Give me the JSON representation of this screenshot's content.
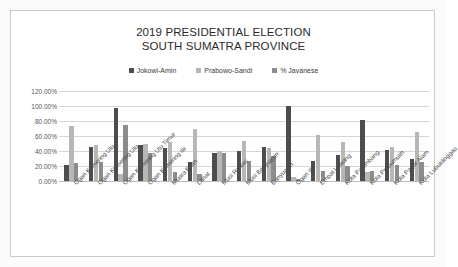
{
  "chart_data": {
    "type": "bar",
    "title": "2019 PRESIDENTIAL ELECTION SOUTH SUMATRA PROVINCE",
    "title_lines": [
      "2019 PRESIDENTIAL ELECTION",
      "SOUTH SUMATRA PROVINCE"
    ],
    "xlabel": "",
    "ylabel": "",
    "ylim": [
      0,
      120
    ],
    "ytick_labels": [
      "120.00%",
      "100.00%",
      "80.00%",
      "60.00%",
      "40.00%",
      "20.00%",
      "0.00%"
    ],
    "ytick_values": [
      120,
      100,
      80,
      60,
      40,
      20,
      0
    ],
    "grid": true,
    "legend_position": "top",
    "categories": [
      "Ogan Komering Ulu",
      "Ogan Komering Ulu",
      "Ogan Komering Ulu Timur",
      "Ogan Komering Ilir",
      "Muara Enim",
      "Lahat",
      "Musi Rawas",
      "Musi Banyuasin",
      "Banyuasin",
      "Ogan Ilir",
      "Empat Lawang",
      "Kota Palembang",
      "Kota Prabumulih",
      "Kota Pagar Alam",
      "Kota Lubuklinggau"
    ],
    "series": [
      {
        "name": "Jokowi-Amin",
        "color": "#4d4d4d",
        "values": [
          22,
          45,
          97,
          48,
          44,
          25,
          37,
          40,
          46,
          100,
          27,
          35,
          82,
          42,
          30
        ]
      },
      {
        "name": "Prabowo-Sandi",
        "color": "#b7b7b7",
        "values": [
          73,
          48,
          10,
          50,
          52,
          70,
          40,
          53,
          44,
          5,
          62,
          52,
          12,
          45,
          65
        ]
      },
      {
        "name": "% Javanese",
        "color": "#8c8c8c",
        "values": [
          24,
          25,
          75,
          38,
          12,
          10,
          38,
          27,
          34,
          3,
          14,
          20,
          13,
          22,
          26
        ]
      }
    ]
  },
  "legend": {
    "items": [
      {
        "label": "Jokowi-Amin",
        "color": "#4d4d4d"
      },
      {
        "label": "Prabowo-Sandi",
        "color": "#b7b7b7"
      },
      {
        "label": "% Javanese",
        "color": "#8c8c8c"
      }
    ]
  }
}
